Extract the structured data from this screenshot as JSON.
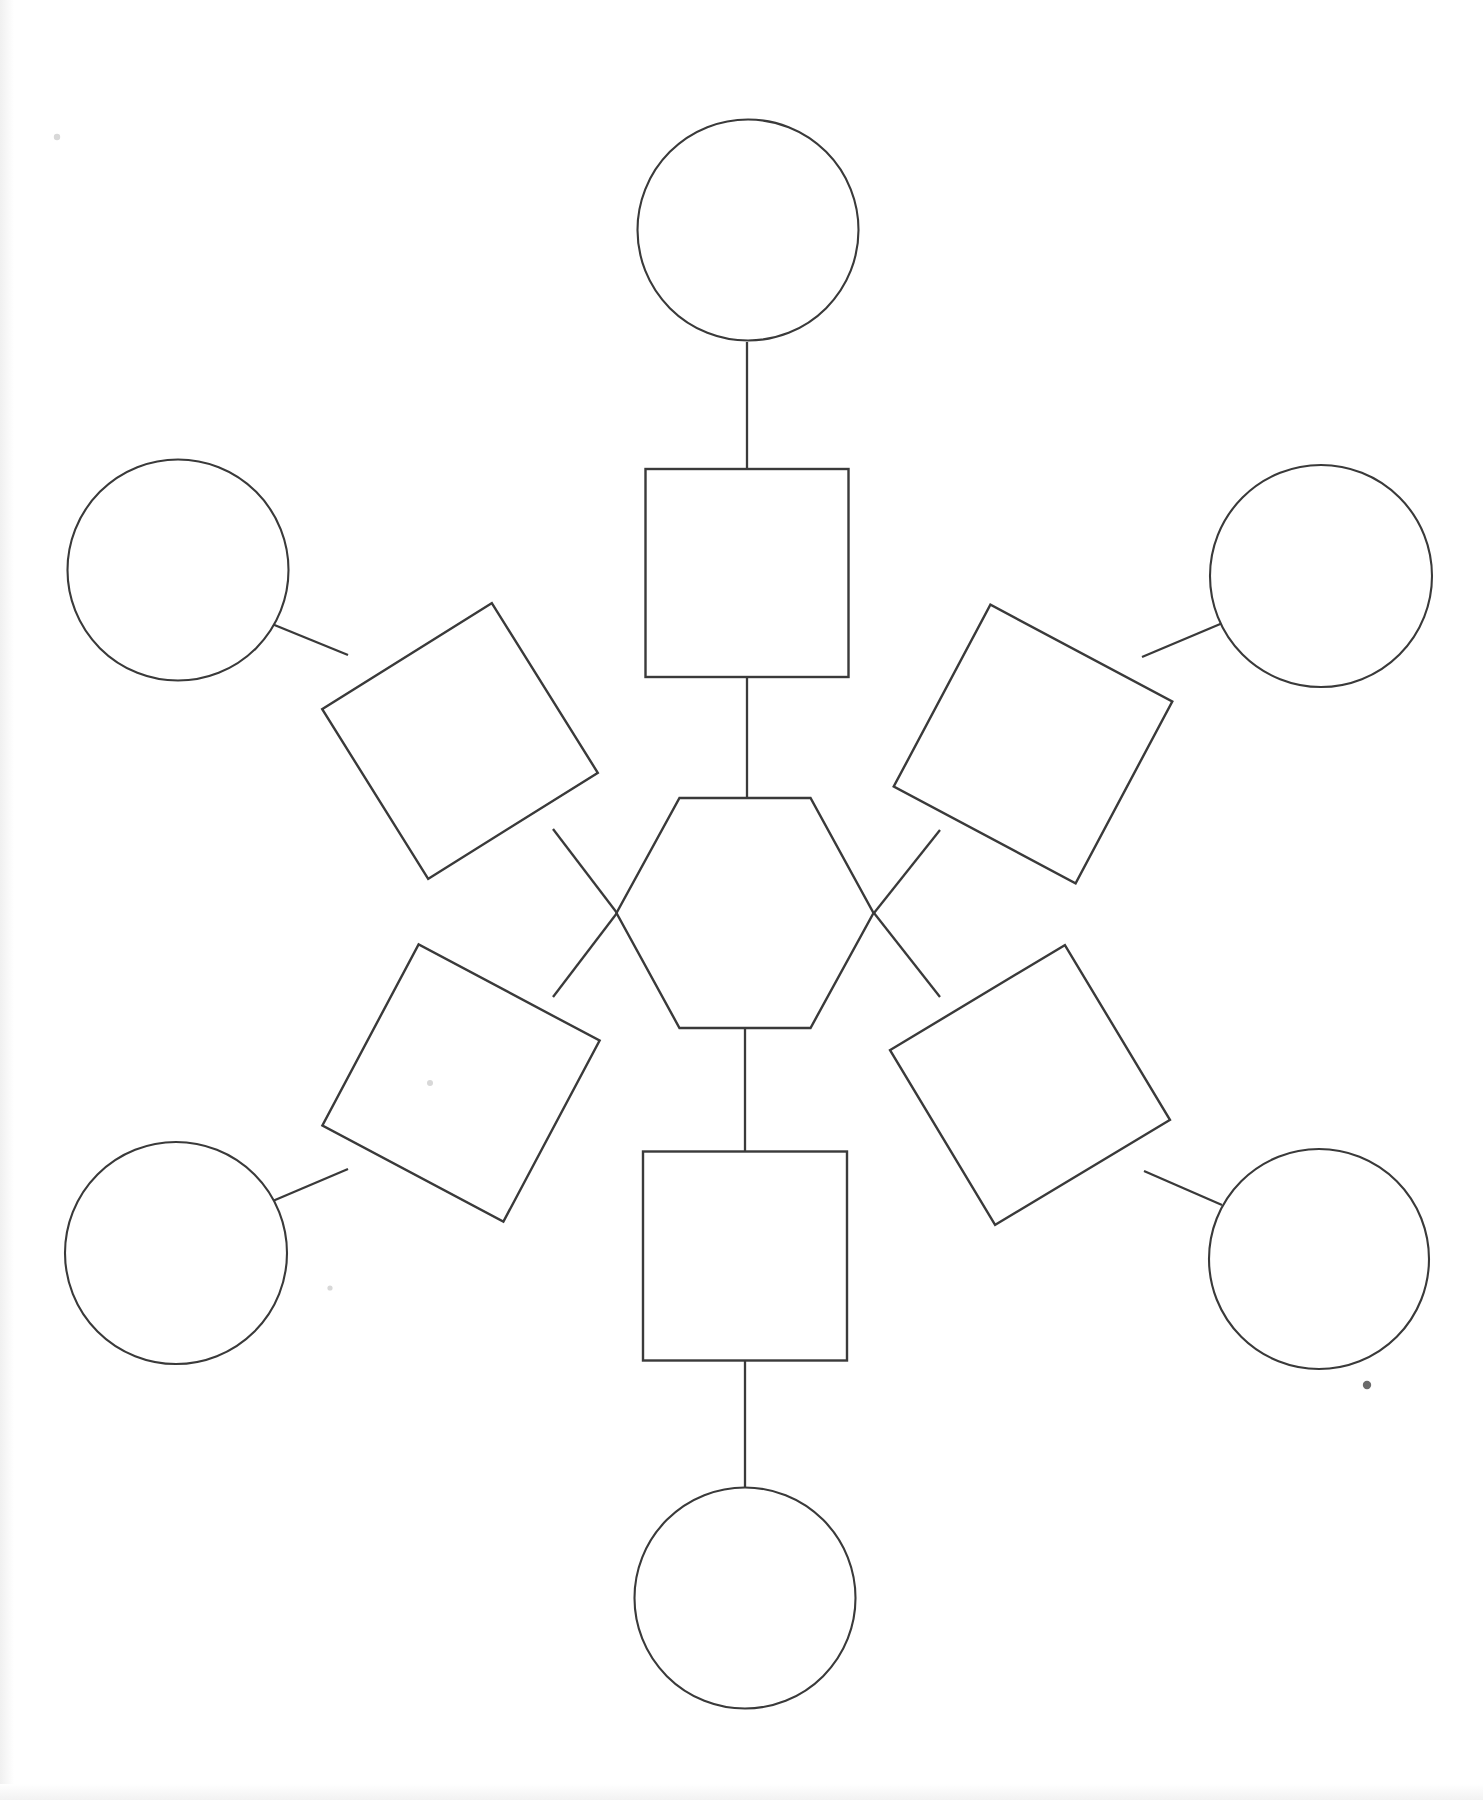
{
  "document": {
    "title": "Blank Graphic Organizer",
    "subtitle": "Hexagon web concept map template",
    "orientation": "portrait",
    "page_width": 1483,
    "page_height": 1800,
    "background_color": "#ffffff",
    "ink_color": "#3a3a3a",
    "text_content": "",
    "notes": "All shapes are empty; no labels or text are printed on the sheet."
  },
  "chart_data": {
    "type": "diagram",
    "title": "",
    "subtitle": "",
    "xlabel": "",
    "ylabel": "",
    "legend": [],
    "nodes": [
      {
        "id": "center",
        "shape": "hexagon",
        "label": "",
        "cx": 745,
        "cy": 913,
        "width": 257,
        "height": 230,
        "rotation": 0,
        "ring": "center"
      },
      {
        "id": "branch-top",
        "shape": "square",
        "label": "",
        "cx": 747,
        "cy": 573,
        "width": 203,
        "height": 208,
        "rotation": 0,
        "ring": "inner"
      },
      {
        "id": "branch-upper-left",
        "shape": "square",
        "label": "",
        "cx": 460,
        "cy": 741,
        "width": 200,
        "height": 200,
        "rotation": -32,
        "ring": "inner"
      },
      {
        "id": "branch-upper-right",
        "shape": "square",
        "label": "",
        "cx": 1033,
        "cy": 744,
        "width": 206,
        "height": 206,
        "rotation": 28,
        "ring": "inner"
      },
      {
        "id": "branch-lower-left",
        "shape": "square",
        "label": "",
        "cx": 461,
        "cy": 1083,
        "width": 205,
        "height": 205,
        "rotation": 28,
        "ring": "inner"
      },
      {
        "id": "branch-lower-right",
        "shape": "square",
        "label": "",
        "cx": 1030,
        "cy": 1085,
        "width": 204,
        "height": 204,
        "rotation": -31,
        "ring": "inner"
      },
      {
        "id": "branch-bottom",
        "shape": "square",
        "label": "",
        "cx": 745,
        "cy": 1256,
        "width": 204,
        "height": 209,
        "rotation": 0,
        "ring": "inner"
      },
      {
        "id": "leaf-top",
        "shape": "circle",
        "label": "",
        "cx": 748,
        "cy": 230,
        "diameter": 221,
        "ring": "outer"
      },
      {
        "id": "leaf-upper-left",
        "shape": "circle",
        "label": "",
        "cx": 178,
        "cy": 570,
        "diameter": 221,
        "ring": "outer"
      },
      {
        "id": "leaf-upper-right",
        "shape": "circle",
        "label": "",
        "cx": 1321,
        "cy": 576,
        "diameter": 222,
        "ring": "outer"
      },
      {
        "id": "leaf-lower-left",
        "shape": "circle",
        "label": "",
        "cx": 176,
        "cy": 1253,
        "diameter": 222,
        "ring": "outer"
      },
      {
        "id": "leaf-lower-right",
        "shape": "circle",
        "label": "",
        "cx": 1319,
        "cy": 1259,
        "diameter": 220,
        "ring": "outer"
      },
      {
        "id": "leaf-bottom",
        "shape": "circle",
        "label": "",
        "cx": 745,
        "cy": 1598,
        "diameter": 221,
        "ring": "outer"
      }
    ],
    "edges": [
      {
        "id": "edge-center-top",
        "from": "center",
        "to": "branch-top",
        "x1": 747,
        "y1": 798,
        "x2": 747,
        "y2": 678
      },
      {
        "id": "edge-center-upper-left",
        "from": "center",
        "to": "branch-upper-left",
        "x1": 617,
        "y1": 913,
        "x2": 553,
        "y2": 829
      },
      {
        "id": "edge-center-upper-right",
        "from": "center",
        "to": "branch-upper-right",
        "x1": 874,
        "y1": 913,
        "x2": 940,
        "y2": 830
      },
      {
        "id": "edge-center-lower-left",
        "from": "center",
        "to": "branch-lower-left",
        "x1": 617,
        "y1": 913,
        "x2": 553,
        "y2": 997
      },
      {
        "id": "edge-center-lower-right",
        "from": "center",
        "to": "branch-lower-right",
        "x1": 874,
        "y1": 913,
        "x2": 940,
        "y2": 997
      },
      {
        "id": "edge-center-bottom",
        "from": "center",
        "to": "branch-bottom",
        "x1": 745,
        "y1": 1028,
        "x2": 745,
        "y2": 1151
      },
      {
        "id": "edge-top",
        "from": "branch-top",
        "to": "leaf-top",
        "x1": 747,
        "y1": 469,
        "x2": 747,
        "y2": 342
      },
      {
        "id": "edge-upper-left",
        "from": "branch-upper-left",
        "to": "leaf-upper-left",
        "x1": 348,
        "y1": 655,
        "x2": 272,
        "y2": 624
      },
      {
        "id": "edge-upper-right",
        "from": "branch-upper-right",
        "to": "leaf-upper-right",
        "x1": 1142,
        "y1": 657,
        "x2": 1225,
        "y2": 622
      },
      {
        "id": "edge-lower-left",
        "from": "branch-lower-left",
        "to": "leaf-lower-left",
        "x1": 348,
        "y1": 1169,
        "x2": 268,
        "y2": 1203
      },
      {
        "id": "edge-lower-right",
        "from": "branch-lower-right",
        "to": "leaf-lower-right",
        "x1": 1144,
        "y1": 1171,
        "x2": 1222,
        "y2": 1205
      },
      {
        "id": "edge-bottom",
        "from": "branch-bottom",
        "to": "leaf-bottom",
        "x1": 745,
        "y1": 1360,
        "x2": 745,
        "y2": 1488
      }
    ],
    "marks": [
      {
        "id": "speck-lower-right",
        "x": 1367,
        "y": 1385,
        "r": 4.2,
        "kind": "ink-speck"
      },
      {
        "id": "speck-center-left",
        "x": 430,
        "y": 1083,
        "r": 3.0,
        "kind": "faint-speck"
      },
      {
        "id": "speck-top-left",
        "x": 57,
        "y": 137,
        "r": 3.2,
        "kind": "faint-speck"
      },
      {
        "id": "speck-mid-left",
        "x": 330,
        "y": 1288,
        "r": 2.6,
        "kind": "faint-speck"
      }
    ],
    "counts": {
      "circles": 6,
      "squares": 2,
      "rotated_squares": 4,
      "hexagons": 1,
      "connectors": 12
    }
  }
}
